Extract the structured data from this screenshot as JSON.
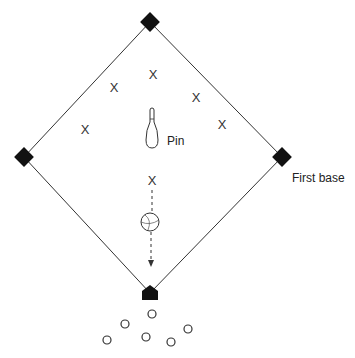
{
  "diagram": {
    "title": "",
    "field": {
      "shape": "diamond",
      "line_color": "#333333",
      "base_color": "#111111"
    },
    "bases": [
      {
        "name": "second-base",
        "x": 150,
        "y": 22
      },
      {
        "name": "third-base",
        "x": 24,
        "y": 157
      },
      {
        "name": "first-base",
        "x": 282,
        "y": 157
      },
      {
        "name": "home-plate",
        "x": 150,
        "y": 293
      }
    ],
    "labels": {
      "first_base": "First base",
      "pin": "Pin"
    },
    "fielders": {
      "symbol": "X",
      "positions": [
        {
          "x": 153,
          "y": 79
        },
        {
          "x": 114,
          "y": 92
        },
        {
          "x": 196,
          "y": 100
        },
        {
          "x": 85,
          "y": 131
        },
        {
          "x": 222,
          "y": 126
        },
        {
          "x": 152,
          "y": 183
        }
      ]
    },
    "kickers": {
      "symbol": "O",
      "positions": [
        {
          "x": 152,
          "y": 318
        },
        {
          "x": 125,
          "y": 328
        },
        {
          "x": 188,
          "y": 332
        },
        {
          "x": 107,
          "y": 344
        },
        {
          "x": 146,
          "y": 341
        },
        {
          "x": 171,
          "y": 346
        }
      ]
    },
    "pin": {
      "x": 152,
      "top": 109,
      "bottom": 148
    },
    "ball": {
      "x": 150,
      "y": 222,
      "r": 9
    },
    "path": {
      "from_y": 190,
      "to_y": 266,
      "style": "dashed-arrow"
    }
  }
}
